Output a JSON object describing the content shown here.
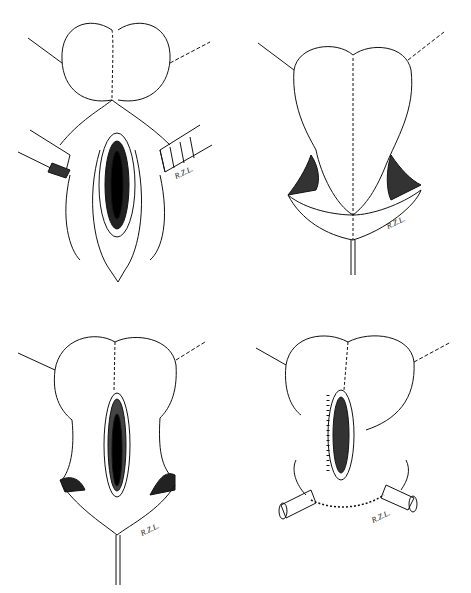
{
  "figure": {
    "type": "surgical line illustration",
    "style": "black ink on white",
    "background": "#ffffff",
    "ink": "#111111",
    "panels": [
      {
        "position": "top-left",
        "description": "retracted incision exposing elongated opening with retractors on both sides",
        "signature": "R.Z.L."
      },
      {
        "position": "top-right",
        "description": "heart-shaped flap closed along midline suture",
        "signature": "R.Z.L."
      },
      {
        "position": "bottom-left",
        "description": "flap with elongated central opening",
        "signature": "R.Z.L."
      },
      {
        "position": "bottom-right",
        "description": "sutured opening with bilateral tubular ends and lower suture line",
        "signature": "R.Z.L."
      }
    ]
  }
}
